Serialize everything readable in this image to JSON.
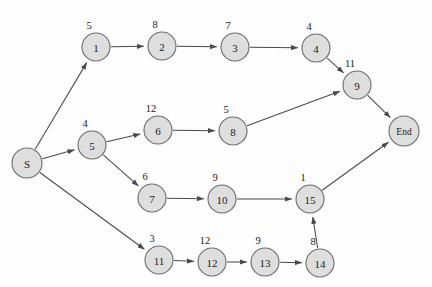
{
  "figure": {
    "type": "activity-network-diagram",
    "background_color": "#fdfdfd",
    "node_fill_color": "#dedede",
    "node_stroke_color": "#6b6b6b",
    "edge_color": "#4a4a4a",
    "text_color": "#1a1a1a"
  },
  "nodes": [
    {
      "id": "S",
      "label": "S",
      "weight": "",
      "cx": 27,
      "cy": 163,
      "r": 15
    },
    {
      "id": "1",
      "label": "1",
      "weight": "5",
      "cx": 96,
      "cy": 47,
      "r": 14
    },
    {
      "id": "2",
      "label": "2",
      "weight": "8",
      "cx": 162,
      "cy": 46,
      "r": 14
    },
    {
      "id": "3",
      "label": "3",
      "weight": "7",
      "cx": 235,
      "cy": 47,
      "r": 14
    },
    {
      "id": "4",
      "label": "4",
      "weight": "4",
      "cx": 316,
      "cy": 48,
      "r": 14
    },
    {
      "id": "5",
      "label": "5",
      "weight": "4",
      "cx": 92,
      "cy": 145,
      "r": 14
    },
    {
      "id": "6",
      "label": "6",
      "weight": "12",
      "cx": 158,
      "cy": 130,
      "r": 14
    },
    {
      "id": "7",
      "label": "7",
      "weight": "6",
      "cx": 152,
      "cy": 198,
      "r": 14
    },
    {
      "id": "8",
      "label": "8",
      "weight": "5",
      "cx": 233,
      "cy": 131,
      "r": 14
    },
    {
      "id": "9",
      "label": "9",
      "weight": "11",
      "cx": 357,
      "cy": 85,
      "r": 14
    },
    {
      "id": "10",
      "label": "10",
      "weight": "9",
      "cx": 222,
      "cy": 199,
      "r": 14
    },
    {
      "id": "11",
      "label": "11",
      "weight": "3",
      "cx": 159,
      "cy": 260,
      "r": 14
    },
    {
      "id": "12",
      "label": "12",
      "weight": "12",
      "cx": 212,
      "cy": 262,
      "r": 14
    },
    {
      "id": "13",
      "label": "13",
      "weight": "9",
      "cx": 265,
      "cy": 262,
      "r": 14
    },
    {
      "id": "14",
      "label": "14",
      "weight": "8",
      "cx": 320,
      "cy": 263,
      "r": 14
    },
    {
      "id": "15",
      "label": "15",
      "weight": "1",
      "cx": 310,
      "cy": 199,
      "r": 14
    },
    {
      "id": "End",
      "label": "End",
      "weight": "",
      "cx": 404,
      "cy": 131,
      "r": 15
    }
  ],
  "edges": [
    {
      "from": "S",
      "to": "1"
    },
    {
      "from": "S",
      "to": "5"
    },
    {
      "from": "S",
      "to": "11"
    },
    {
      "from": "1",
      "to": "2"
    },
    {
      "from": "2",
      "to": "3"
    },
    {
      "from": "3",
      "to": "4"
    },
    {
      "from": "4",
      "to": "9"
    },
    {
      "from": "5",
      "to": "6"
    },
    {
      "from": "5",
      "to": "7"
    },
    {
      "from": "6",
      "to": "8"
    },
    {
      "from": "8",
      "to": "9"
    },
    {
      "from": "7",
      "to": "10"
    },
    {
      "from": "10",
      "to": "15"
    },
    {
      "from": "9",
      "to": "End"
    },
    {
      "from": "15",
      "to": "End"
    },
    {
      "from": "11",
      "to": "12"
    },
    {
      "from": "12",
      "to": "13"
    },
    {
      "from": "13",
      "to": "14"
    },
    {
      "from": "14",
      "to": "15"
    }
  ]
}
